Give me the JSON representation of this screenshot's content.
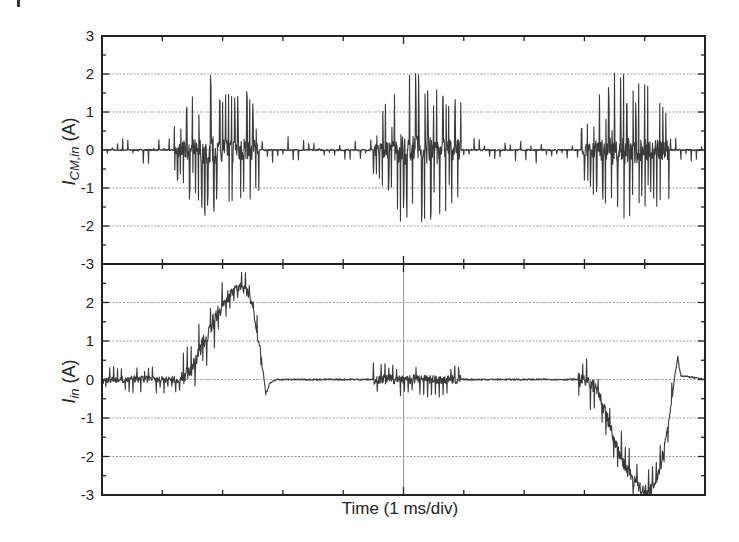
{
  "chart_data": [
    {
      "type": "line",
      "panel": "top",
      "title": "",
      "ylabel": "I_CM,in (A)",
      "ylabel_main": "I",
      "ylabel_sub": "CM,in",
      "ylabel_unit": " (A)",
      "xlabel": "",
      "ylim": [
        -3,
        3
      ],
      "yticks": [
        3,
        2,
        1,
        0,
        -1,
        -2,
        -3
      ],
      "grid": "horizontal dotted at integer values",
      "x_divisions": 10,
      "series": [
        {
          "name": "I_CM,in",
          "description": "Common-mode input current: three bursts of high-frequency spikes, sparse small spikes otherwise",
          "baseline": 0,
          "bursts": [
            {
              "x_start_div": 1.2,
              "x_end_div": 2.6,
              "peak_pos": 2.15,
              "peak_neg": -2.1
            },
            {
              "x_start_div": 4.5,
              "x_end_div": 5.95,
              "peak_pos": 2.25,
              "peak_neg": -2.2
            },
            {
              "x_start_div": 7.95,
              "x_end_div": 9.4,
              "peak_pos": 2.15,
              "peak_neg": -2.2
            }
          ],
          "small_spikes_amplitude": 0.35
        }
      ]
    },
    {
      "type": "line",
      "panel": "bottom",
      "title": "",
      "ylabel": "I_in (A)",
      "ylabel_main": "I",
      "ylabel_sub": "in",
      "ylabel_unit": " (A)",
      "xlabel": "Time (1 ms/div)",
      "ylim": [
        -3,
        3
      ],
      "yticks": [
        2,
        1,
        0,
        -1,
        -2,
        -3
      ],
      "grid": "horizontal dotted at integer values, vertical line at center",
      "x_divisions": 10,
      "series": [
        {
          "name": "I_in",
          "description": "Input current: positive half-sine hump (~2.4 A peak) around 1.5-2.6 div, low-noise burst near center, negative half-sine trough (~-3 A) around 8.0-9.5 div",
          "envelope": [
            [
              0,
              0
            ],
            [
              1.3,
              0
            ],
            [
              1.5,
              0.3
            ],
            [
              1.7,
              1.0
            ],
            [
              1.9,
              1.7
            ],
            [
              2.1,
              2.2
            ],
            [
              2.3,
              2.45
            ],
            [
              2.45,
              2.2
            ],
            [
              2.55,
              1.4
            ],
            [
              2.65,
              0.5
            ],
            [
              2.72,
              -0.4
            ],
            [
              2.78,
              -0.1
            ],
            [
              2.9,
              0
            ],
            [
              4.5,
              0
            ],
            [
              5.95,
              0
            ],
            [
              7.9,
              0
            ],
            [
              8.2,
              -0.2
            ],
            [
              8.4,
              -1.1
            ],
            [
              8.6,
              -2.0
            ],
            [
              8.8,
              -2.6
            ],
            [
              9.0,
              -2.95
            ],
            [
              9.15,
              -2.8
            ],
            [
              9.3,
              -2.0
            ],
            [
              9.42,
              -0.9
            ],
            [
              9.5,
              0.1
            ],
            [
              9.55,
              0.55
            ],
            [
              9.6,
              0.1
            ],
            [
              10,
              0
            ]
          ],
          "noise_bursts": [
            {
              "x_start_div": 0.0,
              "x_end_div": 1.3,
              "amplitude": 0.35
            },
            {
              "x_start_div": 1.3,
              "x_end_div": 2.1,
              "amplitude": 0.8
            },
            {
              "x_start_div": 4.5,
              "x_end_div": 5.95,
              "amplitude": 0.45
            },
            {
              "x_start_div": 7.9,
              "x_end_div": 9.3,
              "amplitude": 0.7
            }
          ]
        }
      ]
    }
  ],
  "labels": {
    "top_ylabel_main": "I",
    "top_ylabel_sub": "CM,in",
    "top_ylabel_unit": " (A)",
    "bottom_ylabel_main": "I",
    "bottom_ylabel_sub": "in",
    "bottom_ylabel_unit": " (A)",
    "xlabel": "Time (1 ms/div)"
  },
  "colors": {
    "trace": "#3a3a3a",
    "frame": "#222222",
    "grid": "#9a9a9a"
  }
}
